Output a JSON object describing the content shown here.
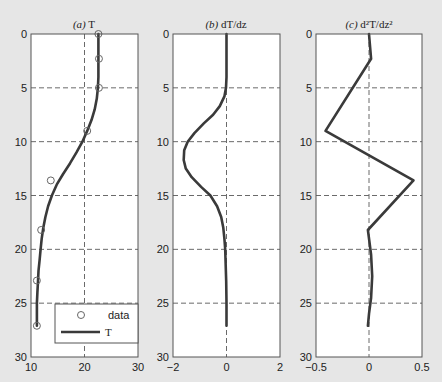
{
  "figure": {
    "background": "#e6e6e6",
    "plot_background": "#ffffff",
    "line_color": "#3a3a3a",
    "grid_color": "#6a6a6a",
    "frame_color": "#555555"
  },
  "chart_data": [
    {
      "id": "a",
      "type": "line",
      "title_prefix": "(a)",
      "title_main": "T",
      "xlabel": "",
      "ylabel": "",
      "xlim": [
        10,
        30
      ],
      "ylim": [
        0,
        30
      ],
      "y_inverted": true,
      "xticks": [
        10,
        20,
        30
      ],
      "yticks": [
        0,
        5,
        10,
        15,
        20,
        25,
        30
      ],
      "grid": {
        "x": [
          20
        ],
        "y": [
          5,
          10,
          15,
          20,
          25
        ]
      },
      "legend": {
        "position": "lower right",
        "entries": [
          {
            "label": "data",
            "style": "marker-circle"
          },
          {
            "label": "T",
            "style": "line"
          }
        ]
      },
      "series": [
        {
          "name": "data",
          "kind": "scatter",
          "marker": "open-circle",
          "x": [
            22.6,
            22.7,
            22.7,
            20.5,
            13.7,
            11.9,
            11.1,
            11.1
          ],
          "y": [
            0.0,
            2.3,
            5.0,
            9.0,
            13.6,
            18.2,
            22.9,
            27.1
          ]
        },
        {
          "name": "T",
          "kind": "line",
          "x": [
            22.6,
            22.6,
            22.6,
            22.5,
            22.3,
            21.9,
            21.3,
            20.5,
            19.6,
            18.5,
            17.3,
            16.0,
            14.8,
            13.9,
            13.2,
            12.7,
            12.3,
            12.0,
            11.8,
            11.6,
            11.4,
            11.3,
            11.2,
            11.1,
            11.1,
            11.1
          ],
          "y": [
            0.0,
            2.0,
            4.0,
            5.0,
            6.0,
            7.0,
            8.0,
            9.0,
            10.0,
            11.0,
            12.0,
            13.0,
            14.0,
            15.0,
            16.0,
            17.0,
            18.0,
            19.0,
            20.0,
            21.0,
            22.0,
            23.0,
            24.0,
            25.0,
            26.0,
            27.1
          ]
        }
      ]
    },
    {
      "id": "b",
      "type": "line",
      "title_prefix": "(b)",
      "title_main": "dT/dz",
      "xlabel": "",
      "ylabel": "",
      "xlim": [
        -2,
        2
      ],
      "ylim": [
        0,
        30
      ],
      "y_inverted": true,
      "xticks": [
        -2,
        0,
        2
      ],
      "xtick_labels": [
        "−2",
        "0",
        "2"
      ],
      "yticks": [
        0,
        5,
        10,
        15,
        20,
        25,
        30
      ],
      "grid": {
        "x": [
          0
        ],
        "y": [
          5,
          10,
          15,
          20,
          25
        ]
      },
      "series": [
        {
          "name": "dT/dz",
          "kind": "line",
          "x": [
            0.0,
            0.0,
            0.0,
            -0.02,
            -0.08,
            -0.25,
            -0.5,
            -0.85,
            -1.2,
            -1.45,
            -1.58,
            -1.6,
            -1.52,
            -1.3,
            -0.95,
            -0.6,
            -0.35,
            -0.2,
            -0.12,
            -0.08,
            -0.05,
            -0.03,
            -0.01,
            0.0,
            0.0,
            0.0
          ],
          "y": [
            0.0,
            2.0,
            4.0,
            5.0,
            5.8,
            6.7,
            7.5,
            8.3,
            9.2,
            10.0,
            10.8,
            11.7,
            12.5,
            13.3,
            14.2,
            15.0,
            16.0,
            17.0,
            18.0,
            19.0,
            20.0,
            21.5,
            23.0,
            25.0,
            26.0,
            27.1
          ]
        }
      ]
    },
    {
      "id": "c",
      "type": "line",
      "title_prefix": "(c)",
      "title_main": "d²T/dz²",
      "xlabel": "",
      "ylabel": "",
      "xlim": [
        -0.5,
        0.5
      ],
      "ylim": [
        0,
        30
      ],
      "y_inverted": true,
      "xticks": [
        -0.5,
        0,
        0.5
      ],
      "xtick_labels": [
        "−0.5",
        "0",
        "0.5"
      ],
      "yticks": [
        0,
        5,
        10,
        15,
        20,
        25,
        30
      ],
      "grid": {
        "x": [
          0
        ],
        "y": [
          5,
          10,
          15,
          20,
          25
        ]
      },
      "series": [
        {
          "name": "d2T/dz2",
          "kind": "line",
          "x": [
            0.0,
            0.02,
            -0.41,
            0.42,
            -0.01,
            0.02,
            0.03,
            0.02,
            0.0,
            -0.01
          ],
          "y": [
            0.0,
            2.3,
            9.0,
            13.6,
            18.2,
            20.5,
            22.5,
            24.5,
            26.0,
            27.1
          ]
        }
      ]
    }
  ],
  "layout": {
    "panels": [
      {
        "id": "a",
        "left": 31,
        "top": 34,
        "width": 107,
        "height": 323
      },
      {
        "id": "b",
        "left": 173,
        "top": 34,
        "width": 107,
        "height": 323
      },
      {
        "id": "c",
        "left": 316,
        "top": 34,
        "width": 106,
        "height": 323
      }
    ],
    "legend_box": {
      "left": 55,
      "top": 304,
      "width": 83,
      "height": 39
    }
  }
}
